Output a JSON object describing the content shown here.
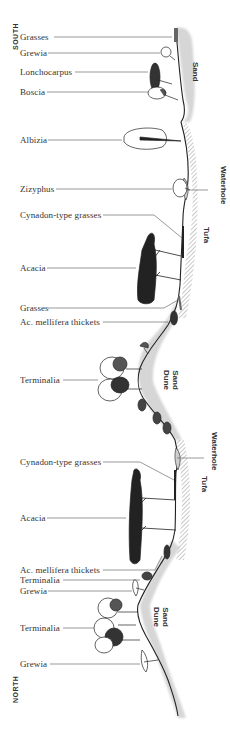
{
  "orientation": {
    "top": "SOUTH",
    "bottom": "NORTH"
  },
  "plant_labels": [
    {
      "id": "grasses-1",
      "text": "Grasses",
      "y": 36
    },
    {
      "id": "grewia-1",
      "text": "Grewia",
      "y": 52
    },
    {
      "id": "lonchocarpus",
      "text": "Lonchocarpus",
      "y": 71
    },
    {
      "id": "boscia",
      "text": "Boscia",
      "y": 91
    },
    {
      "id": "albizia",
      "text": "Albizia",
      "y": 139
    },
    {
      "id": "zizyphus",
      "text": "Zizyphus",
      "y": 188
    },
    {
      "id": "cynadon-1",
      "text": "Cynadon-type grasses",
      "y": 214
    },
    {
      "id": "acacia-1",
      "text": "Acacia",
      "y": 267
    },
    {
      "id": "grasses-2",
      "text": "Grasses",
      "y": 307
    },
    {
      "id": "mellifera-1",
      "text": "Ac. mellifera thickets",
      "y": 321
    },
    {
      "id": "terminalia-1",
      "text": "Terminalia",
      "y": 379
    },
    {
      "id": "cynadon-2",
      "text": "Cynadon-type grasses",
      "y": 461
    },
    {
      "id": "acacia-2",
      "text": "Acacia",
      "y": 517
    },
    {
      "id": "mellifera-2",
      "text": "Ac. mellifera thickets",
      "y": 569
    },
    {
      "id": "terminalia-2",
      "text": "Terminalia",
      "y": 579
    },
    {
      "id": "grewia-2",
      "text": "Grewia",
      "y": 590
    },
    {
      "id": "terminalia-3",
      "text": "Terminalia",
      "y": 627
    },
    {
      "id": "grewia-3",
      "text": "Grewia",
      "y": 663
    }
  ],
  "terrain_labels": [
    {
      "id": "sand",
      "lines": [
        "Sand"
      ],
      "x": 194,
      "y": 62
    },
    {
      "id": "waterhole-1",
      "lines": [
        "Waterhole"
      ],
      "x": 222,
      "y": 180
    },
    {
      "id": "tufa-1",
      "lines": [
        "Tufa"
      ],
      "x": 205,
      "y": 227
    },
    {
      "id": "sand-dune-1",
      "lines": [
        "Sand",
        "Dune"
      ],
      "x": 170,
      "y": 374
    },
    {
      "id": "waterhole-2",
      "lines": [
        "Waterhole"
      ],
      "x": 213,
      "y": 452
    },
    {
      "id": "tufa-2",
      "lines": [
        "Tufa"
      ],
      "x": 203,
      "y": 477
    },
    {
      "id": "sand-dune-2",
      "lines": [
        "Sand",
        "Dune"
      ],
      "x": 160,
      "y": 609
    }
  ],
  "colors": {
    "ink": "#222222",
    "text": "#333333",
    "sand_shade": "#cfcfcf",
    "leader": "#555555",
    "hatch": "#777777"
  }
}
